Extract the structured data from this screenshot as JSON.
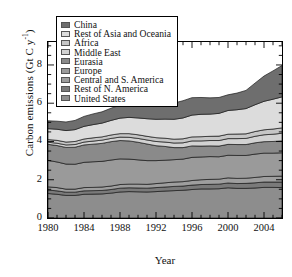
{
  "chart_data": {
    "type": "area",
    "title": "",
    "xlabel": "Year",
    "ylabel": "Carbon emissions (Gt C y",
    "ylabel_exponent": "-1",
    "ylabel_close": ")",
    "xlim": [
      1980,
      2006
    ],
    "ylim": [
      0,
      9.2
    ],
    "yticks": [
      0,
      2,
      4,
      6,
      8
    ],
    "ytick_labels": [
      "0",
      "2",
      "4",
      "6",
      "8"
    ],
    "xticks": [
      1980,
      1984,
      1988,
      1992,
      1996,
      2000,
      2004
    ],
    "xtick_labels": [
      "1980",
      "1984",
      "1988",
      "1992",
      "1996",
      "2000",
      "2004"
    ],
    "minor_xtick_interval": 1,
    "minor_ytick_interval": 0.5,
    "grid": false,
    "stacked": true,
    "legend_position": "upper-left-inside",
    "x": [
      1980,
      1981,
      1982,
      1983,
      1984,
      1985,
      1986,
      1987,
      1988,
      1989,
      1990,
      1991,
      1992,
      1993,
      1994,
      1995,
      1996,
      1997,
      1998,
      1999,
      2000,
      2001,
      2002,
      2003,
      2004,
      2005,
      2006
    ],
    "series": [
      {
        "name": "United States",
        "color": "#8d8d8d",
        "values": [
          1.28,
          1.24,
          1.18,
          1.18,
          1.24,
          1.25,
          1.26,
          1.3,
          1.36,
          1.38,
          1.37,
          1.36,
          1.38,
          1.41,
          1.43,
          1.45,
          1.49,
          1.52,
          1.52,
          1.53,
          1.58,
          1.55,
          1.55,
          1.57,
          1.6,
          1.6,
          1.59
        ]
      },
      {
        "name": "Rest of N. America",
        "color": "#7a7a7a",
        "values": [
          0.18,
          0.18,
          0.17,
          0.17,
          0.18,
          0.18,
          0.18,
          0.19,
          0.2,
          0.2,
          0.2,
          0.2,
          0.21,
          0.21,
          0.22,
          0.22,
          0.23,
          0.23,
          0.24,
          0.24,
          0.25,
          0.25,
          0.26,
          0.27,
          0.28,
          0.28,
          0.29
        ]
      },
      {
        "name": "Central and S. America",
        "color": "#9e9e9e",
        "values": [
          0.17,
          0.17,
          0.16,
          0.16,
          0.17,
          0.17,
          0.18,
          0.18,
          0.19,
          0.19,
          0.2,
          0.2,
          0.21,
          0.22,
          0.23,
          0.23,
          0.24,
          0.25,
          0.26,
          0.26,
          0.27,
          0.27,
          0.27,
          0.28,
          0.29,
          0.3,
          0.31
        ]
      },
      {
        "name": "Europe",
        "color": "#9a9a9a",
        "values": [
          1.38,
          1.34,
          1.31,
          1.3,
          1.32,
          1.34,
          1.34,
          1.36,
          1.34,
          1.31,
          1.27,
          1.24,
          1.2,
          1.18,
          1.17,
          1.18,
          1.21,
          1.19,
          1.19,
          1.17,
          1.18,
          1.2,
          1.19,
          1.22,
          1.22,
          1.21,
          1.22
        ]
      },
      {
        "name": "Eurasia",
        "color": "#8a8a8a",
        "values": [
          0.84,
          0.86,
          0.87,
          0.89,
          0.91,
          0.92,
          0.94,
          0.96,
          0.96,
          0.95,
          0.92,
          0.87,
          0.78,
          0.72,
          0.63,
          0.6,
          0.6,
          0.57,
          0.56,
          0.56,
          0.57,
          0.57,
          0.57,
          0.59,
          0.6,
          0.61,
          0.62
        ]
      },
      {
        "name": "Middle East",
        "color": "#d2d2d2",
        "values": [
          0.11,
          0.12,
          0.13,
          0.14,
          0.15,
          0.16,
          0.17,
          0.17,
          0.18,
          0.19,
          0.2,
          0.21,
          0.22,
          0.23,
          0.24,
          0.25,
          0.26,
          0.27,
          0.28,
          0.29,
          0.3,
          0.31,
          0.32,
          0.34,
          0.36,
          0.38,
          0.4
        ]
      },
      {
        "name": "Africa",
        "color": "#c6c6c6",
        "values": [
          0.14,
          0.15,
          0.15,
          0.16,
          0.16,
          0.17,
          0.17,
          0.18,
          0.18,
          0.19,
          0.19,
          0.19,
          0.2,
          0.2,
          0.2,
          0.21,
          0.21,
          0.22,
          0.22,
          0.23,
          0.23,
          0.24,
          0.24,
          0.25,
          0.26,
          0.27,
          0.28
        ]
      },
      {
        "name": "Rest of Asia and Oceania",
        "color": "#dcdcdc",
        "values": [
          0.57,
          0.58,
          0.6,
          0.62,
          0.66,
          0.69,
          0.72,
          0.76,
          0.81,
          0.85,
          0.88,
          0.92,
          0.96,
          1.0,
          1.04,
          1.09,
          1.14,
          1.17,
          1.16,
          1.19,
          1.24,
          1.27,
          1.32,
          1.4,
          1.49,
          1.56,
          1.62
        ]
      },
      {
        "name": "China",
        "color": "#6e6e6e",
        "values": [
          0.41,
          0.42,
          0.45,
          0.48,
          0.52,
          0.56,
          0.59,
          0.64,
          0.68,
          0.7,
          0.7,
          0.73,
          0.76,
          0.8,
          0.85,
          0.9,
          0.91,
          0.88,
          0.85,
          0.83,
          0.82,
          0.87,
          0.95,
          1.13,
          1.32,
          1.48,
          1.64
        ]
      }
    ],
    "legend_order": [
      "China",
      "Rest of Asia and Oceania",
      "Africa",
      "Middle East",
      "Eurasia",
      "Europe",
      "Central and S. America",
      "Rest of N. America",
      "United States"
    ]
  }
}
